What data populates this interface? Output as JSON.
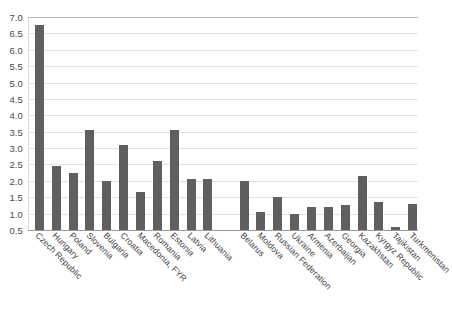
{
  "chart_data": {
    "type": "bar",
    "title": "",
    "title_remnant": "",
    "xlabel": "",
    "ylabel": "",
    "ylim": [
      0.5,
      7.0
    ],
    "ytick_step": 0.5,
    "grid": true,
    "legend": "none",
    "bar_color": "#5f5f5f",
    "gridline_color": "#e2e2e2",
    "categories": [
      "Czech Republic",
      "Hungary",
      "Poland",
      "Slovenia",
      "Bulgaria",
      "Croatia",
      "Macedonia, FYR",
      "Romania",
      "Estonia",
      "Latvia",
      "Lithuania",
      "Belarus",
      "Moldova",
      "Russian Federation",
      "Ukraine",
      "Armenia",
      "Azerbaijan",
      "Georgia",
      "Kazakhstan",
      "Kyrgyz Republic",
      "Tajikistan",
      "Turkmenistan"
    ],
    "values": [
      6.75,
      2.45,
      2.25,
      3.55,
      2.0,
      3.1,
      1.65,
      2.6,
      3.55,
      2.05,
      2.05,
      2.0,
      1.05,
      1.5,
      1.0,
      1.2,
      1.2,
      1.25,
      2.15,
      1.35,
      0.6,
      1.3
    ],
    "group_gap_after_index": 10,
    "ytick_labels": [
      "7.0",
      "6.5",
      "6.0",
      "5.5",
      "5.0",
      "4.5",
      "4.0",
      "3.5",
      "3.0",
      "2.5",
      "2.0",
      "1.5",
      "1.0",
      "0.5"
    ],
    "ytick_values": [
      7.0,
      6.5,
      6.0,
      5.5,
      5.0,
      4.5,
      4.0,
      3.5,
      3.0,
      2.5,
      2.0,
      1.5,
      1.0,
      0.5
    ]
  }
}
